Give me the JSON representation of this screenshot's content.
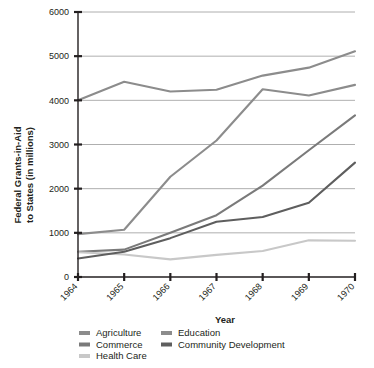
{
  "chart_data": {
    "type": "line",
    "title": "",
    "xlabel": "Year",
    "ylabel": "Federal Grants-in-Aid to States (in millions)",
    "ylabel_lines": [
      "Federal Grants-in-Aid",
      "to States (in millions)"
    ],
    "categories": [
      "1964",
      "1965",
      "1966",
      "1967",
      "1968",
      "1969",
      "1970"
    ],
    "x": [
      1964,
      1965,
      1966,
      1967,
      1968,
      1969,
      1970
    ],
    "ylim": [
      0,
      6000
    ],
    "yticks": [
      0,
      1000,
      2000,
      3000,
      4000,
      5000,
      6000
    ],
    "ytick_labels": [
      "0",
      "1000",
      "2000",
      "3000",
      "4000",
      "5000",
      "6000"
    ],
    "grid": true,
    "grid_axis": "y",
    "legend_position": "bottom",
    "series": [
      {
        "name": "Agriculture",
        "color": "#8c8c8c",
        "values": [
          970,
          1070,
          2270,
          3090,
          4250,
          4110,
          4350
        ]
      },
      {
        "name": "Commerce",
        "color": "#7a7a7a",
        "values": [
          570,
          620,
          1000,
          1400,
          2070,
          2870,
          3660
        ]
      },
      {
        "name": "Health Care",
        "color": "#c8c8c8",
        "values": [
          560,
          510,
          400,
          500,
          590,
          830,
          820
        ]
      },
      {
        "name": "Education",
        "color": "#8c8c8c",
        "values": [
          4000,
          4420,
          4200,
          4240,
          4560,
          4740,
          5110
        ]
      },
      {
        "name": "Community Development",
        "color": "#5e5e5e",
        "values": [
          420,
          570,
          880,
          1250,
          1360,
          1680,
          2590
        ]
      }
    ]
  },
  "legend": {
    "column_one": [
      "Agriculture",
      "Commerce",
      "Health Care"
    ],
    "column_two": [
      "Education",
      "Community Development"
    ]
  }
}
